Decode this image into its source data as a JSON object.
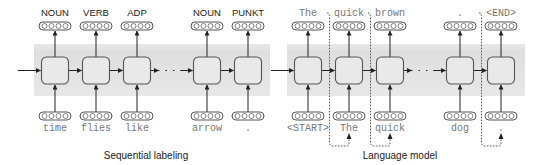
{
  "panels": [
    {
      "id": "sequential-labeling",
      "caption": "Sequential labeling",
      "label_style": "sans",
      "outputs": [
        "NOUN",
        "VERB",
        "ADP",
        "NOUN",
        "PUNKT"
      ],
      "inputs": [
        "time",
        "flies",
        "like",
        "arrow",
        "."
      ],
      "feedback": false
    },
    {
      "id": "language-model",
      "caption": "Language model",
      "label_style": "mono",
      "outputs": [
        "The",
        "quick",
        "brown",
        ".",
        "<END>"
      ],
      "inputs": [
        "<START>",
        "The",
        "quick",
        "dog",
        "."
      ],
      "feedback": true
    }
  ],
  "colors": {
    "band": "#e4e4e4",
    "cell_fill": "#e9e9e9",
    "cell_stroke": "#555555",
    "arrow": "#222222",
    "pill_stroke": "#444444",
    "dashed": "#444444"
  }
}
